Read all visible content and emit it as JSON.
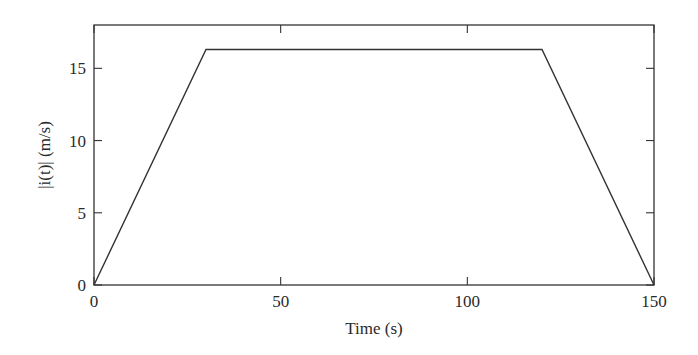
{
  "chart_data": {
    "type": "line",
    "title": "",
    "xlabel": "Time (s)",
    "ylabel": "|i(t)| (m/s)",
    "xlim": [
      0,
      150
    ],
    "ylim": [
      0,
      18
    ],
    "xticks": [
      0,
      50,
      100,
      150
    ],
    "yticks": [
      0,
      5,
      10,
      15
    ],
    "xtick_labels": [
      "0",
      "50",
      "100",
      "150"
    ],
    "ytick_labels": [
      "0",
      "5",
      "10",
      "15"
    ],
    "grid": false,
    "legend": null,
    "series": [
      {
        "name": "|i(t)|",
        "color": "#333333",
        "x": [
          0,
          30,
          120,
          150
        ],
        "y": [
          0,
          16.3,
          16.3,
          0
        ]
      }
    ]
  }
}
